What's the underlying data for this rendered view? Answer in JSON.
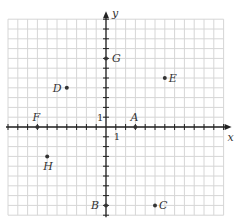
{
  "diagram": {
    "type": "coordinate-plane",
    "axes": {
      "x_label": "x",
      "y_label": "y",
      "unit_label_x": "1",
      "unit_label_y": "1"
    },
    "grid": {
      "x_range": [
        -10,
        12
      ],
      "y_range": [
        -9,
        11
      ]
    },
    "colors": {
      "grid": "#d6d6d6",
      "axis": "#222222",
      "point": "#333333",
      "text": "#333333"
    }
  },
  "chart_data": {
    "type": "scatter",
    "title": "",
    "xlabel": "x",
    "ylabel": "y",
    "grid": true,
    "points": [
      {
        "label": "A",
        "x": 3,
        "y": 0
      },
      {
        "label": "B",
        "x": 0,
        "y": -8
      },
      {
        "label": "C",
        "x": 5,
        "y": -8
      },
      {
        "label": "D",
        "x": -4,
        "y": 4
      },
      {
        "label": "E",
        "x": 6,
        "y": 5
      },
      {
        "label": "F",
        "x": -7,
        "y": 0
      },
      {
        "label": "G",
        "x": 0,
        "y": 7
      },
      {
        "label": "H",
        "x": -6,
        "y": -3
      }
    ]
  }
}
